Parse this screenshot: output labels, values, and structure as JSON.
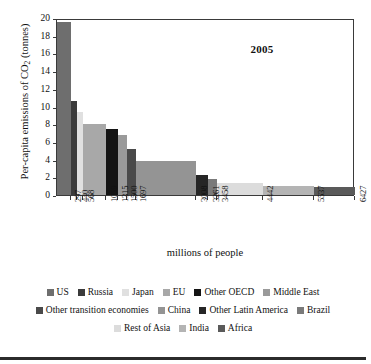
{
  "chart_data": {
    "type": "bar",
    "variant": "variable-width-bar",
    "title": "2005",
    "xlabel": "millions of people",
    "ylabel": "Per-capita emissions of CO2 (tonnes)",
    "ylabel_rich": "Per-capita emissions of CO₂ (tonnes)",
    "ylim": [
      0,
      20
    ],
    "yticks": [
      0,
      2,
      4,
      6,
      8,
      10,
      12,
      14,
      16,
      18,
      20
    ],
    "xlim": [
      0,
      6427
    ],
    "xtick_labels": [
      "297",
      "440",
      "568",
      "1059",
      "1315",
      "1500",
      "1697",
      "3008",
      "3261",
      "3458",
      "4442",
      "5537",
      "6427"
    ],
    "xticks": [
      297,
      440,
      568,
      1059,
      1315,
      1500,
      1697,
      3008,
      3261,
      3458,
      4442,
      5537,
      6427
    ],
    "grid": false,
    "legend_position": "below",
    "categories": [
      "US",
      "Russia",
      "Japan",
      "EU",
      "Other OECD",
      "Middle East",
      "Other transition economies",
      "China",
      "Other Latin America",
      "Brazil",
      "Rest of Asia",
      "India",
      "Africa"
    ],
    "values": [
      19.5,
      10.65,
      9.4,
      8.05,
      7.45,
      6.75,
      5.15,
      3.85,
      2.3,
      1.8,
      1.4,
      1.05,
      0.95
    ],
    "widths": [
      297,
      143,
      128,
      491,
      256,
      185,
      197,
      1311,
      253,
      197,
      984,
      1095,
      890
    ],
    "cumulative": [
      297,
      440,
      568,
      1059,
      1315,
      1500,
      1697,
      3008,
      3261,
      3458,
      4442,
      5537,
      6427
    ],
    "colors": [
      "#6e6e6e",
      "#3b3b3b",
      "#e0e0e0",
      "#a8a8a8",
      "#141414",
      "#9a9a9a",
      "#4a4a4a",
      "#949494",
      "#262626",
      "#7a7a7a",
      "#dcdcdc",
      "#b4b4b4",
      "#5a5a5a"
    ]
  },
  "legend": {
    "rows": [
      [
        {
          "label": "US",
          "color": "#6e6e6e"
        },
        {
          "label": "Russia",
          "color": "#3b3b3b"
        },
        {
          "label": "Japan",
          "color": "#e0e0e0"
        },
        {
          "label": "EU",
          "color": "#a8a8a8"
        },
        {
          "label": "Other OECD",
          "color": "#141414"
        },
        {
          "label": "Middle East",
          "color": "#9a9a9a"
        }
      ],
      [
        {
          "label": "Other transition economies",
          "color": "#4a4a4a"
        },
        {
          "label": "China",
          "color": "#949494"
        },
        {
          "label": "Other Latin America",
          "color": "#262626"
        },
        {
          "label": "Brazil",
          "color": "#7a7a7a"
        }
      ],
      [
        {
          "label": "Rest of Asia",
          "color": "#dcdcdc"
        },
        {
          "label": "India",
          "color": "#b4b4b4"
        },
        {
          "label": "Africa",
          "color": "#5a5a5a"
        }
      ]
    ]
  }
}
